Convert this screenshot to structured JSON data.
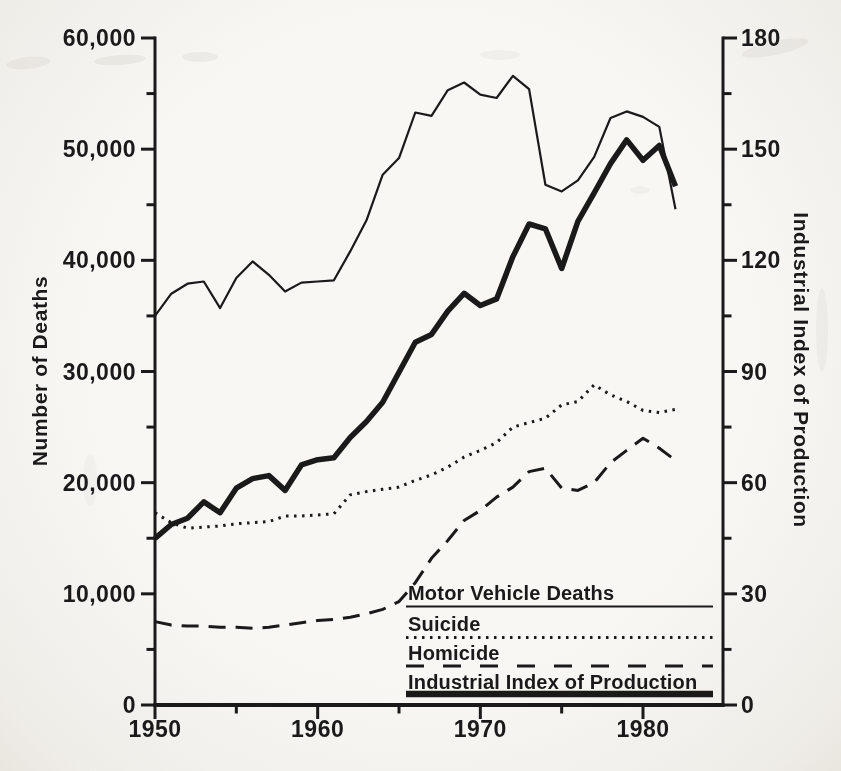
{
  "colors": {
    "ink": "#1a1a1a",
    "paper": "#f6f5f1"
  },
  "chart_data": {
    "type": "line",
    "title": "",
    "grid": false,
    "legend_position": "inside-bottom-right",
    "years": [
      1950,
      1951,
      1952,
      1953,
      1954,
      1955,
      1956,
      1957,
      1958,
      1959,
      1960,
      1961,
      1962,
      1963,
      1964,
      1965,
      1966,
      1967,
      1968,
      1969,
      1970,
      1971,
      1972,
      1973,
      1974,
      1975,
      1976,
      1977,
      1978,
      1979,
      1980,
      1981,
      1982
    ],
    "x_axis": {
      "ticks_major": [
        1950,
        1960,
        1970,
        1980
      ],
      "ticks_minor": [
        1955,
        1965,
        1975
      ],
      "min": 1950,
      "max": 1985
    },
    "left_axis": {
      "label": "Number of Deaths",
      "min": 0,
      "max": 60000,
      "tick_step_major": 10000,
      "tick_step_minor": 5000,
      "tick_labels": [
        "0",
        "10,000",
        "20,000",
        "30,000",
        "40,000",
        "50,000",
        "60,000"
      ]
    },
    "right_axis": {
      "label": "Industrial Index of Production",
      "min": 0,
      "max": 180,
      "tick_step_major": 30,
      "tick_step_minor": 15,
      "tick_labels": [
        "0",
        "30",
        "60",
        "90",
        "120",
        "150",
        "180"
      ]
    },
    "series": [
      {
        "name": "motor-vehicle-deaths",
        "label": "Motor Vehicle Deaths",
        "axis": "left",
        "style": "solid-thin",
        "values": [
          35000,
          37000,
          37900,
          38100,
          35700,
          38400,
          39900,
          38700,
          37200,
          38000,
          38100,
          38200,
          40800,
          43600,
          47700,
          49200,
          53300,
          53000,
          55300,
          56000,
          54900,
          54600,
          56600,
          55400,
          46800,
          46200,
          47200,
          49300,
          52800,
          53400,
          52900,
          52000,
          44600
        ]
      },
      {
        "name": "suicide",
        "label": "Suicide",
        "axis": "left",
        "style": "dotted",
        "values": [
          17300,
          16400,
          15900,
          16000,
          16100,
          16300,
          16400,
          16500,
          17000,
          17000,
          17100,
          17200,
          18900,
          19200,
          19400,
          19600,
          20200,
          20700,
          21400,
          22300,
          22900,
          23600,
          25000,
          25400,
          25800,
          27000,
          27300,
          28800,
          27900,
          27300,
          26500,
          26300,
          26600
        ]
      },
      {
        "name": "homicide",
        "label": "Homicide",
        "axis": "left",
        "style": "dashed",
        "values": [
          7500,
          7200,
          7100,
          7100,
          7000,
          7000,
          6900,
          7000,
          7200,
          7400,
          7600,
          7700,
          7900,
          8200,
          8600,
          9300,
          11000,
          13200,
          14800,
          16600,
          17500,
          18700,
          19600,
          21000,
          21300,
          19500,
          19300,
          20000,
          21800,
          22900,
          24000,
          23100,
          22000
        ]
      },
      {
        "name": "industrial-index-of-production",
        "label": "Industrial Index of Production",
        "axis": "right",
        "style": "solid-thick",
        "values": [
          45,
          48.7,
          50.4,
          54.8,
          51.9,
          58.5,
          61.1,
          61.9,
          57.9,
          64.8,
          66.2,
          66.7,
          72.2,
          76.5,
          81.7,
          89.8,
          97.9,
          100,
          106.3,
          111.1,
          107.8,
          109.6,
          121,
          129.8,
          128.5,
          117.8,
          130.5,
          138.2,
          146.1,
          152.5,
          147,
          151,
          140
        ]
      }
    ],
    "layout": {
      "x0": 155,
      "x1": 723,
      "y0": 705,
      "y1": 38,
      "year0": 1950,
      "px_per_year": 16.2667
    }
  }
}
